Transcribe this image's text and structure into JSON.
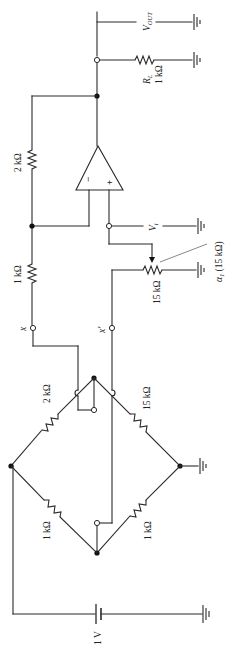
{
  "diagram": {
    "type": "circuit-schematic",
    "orientation": "rotated-90",
    "colors": {
      "wire": "#2a2a2a",
      "background": "#ffffff",
      "node": "#111111"
    }
  },
  "labels": {
    "vout": "V",
    "vout_sub": "OUT",
    "rl_name": "R",
    "rl_sub": "L",
    "rl_value": "1 kΩ",
    "rf_value": "2 kΩ",
    "rin_value": "1 kΩ",
    "vi": "V",
    "vi_sub": "i",
    "pot_value": "15 kΩ",
    "pot_wiper": "α",
    "pot_wiper_sub": "1",
    "pot_wiper_rest": " (15 kΩ)",
    "term_x": "x",
    "term_x_prime": "x′",
    "bridge_top_left": "2 kΩ",
    "bridge_top_right": "15 kΩ",
    "bridge_bottom_left": "1 kΩ",
    "bridge_bottom_right": "1 kΩ",
    "battery": "1 V",
    "opamp_minus": "−",
    "opamp_plus": "+"
  },
  "components": [
    {
      "id": "RL",
      "type": "resistor",
      "value": "1 kΩ",
      "role": "load"
    },
    {
      "id": "Rf",
      "type": "resistor",
      "value": "2 kΩ",
      "role": "feedback"
    },
    {
      "id": "Rin",
      "type": "resistor",
      "value": "1 kΩ",
      "role": "input"
    },
    {
      "id": "Rpot",
      "type": "potentiometer",
      "value": "15 kΩ",
      "wiper": "α1 (15 kΩ)"
    },
    {
      "id": "R1",
      "type": "resistor",
      "value": "2 kΩ",
      "role": "bridge"
    },
    {
      "id": "R2",
      "type": "resistor",
      "value": "15 kΩ",
      "role": "bridge"
    },
    {
      "id": "R3",
      "type": "resistor",
      "value": "1 kΩ",
      "role": "bridge"
    },
    {
      "id": "R4",
      "type": "resistor",
      "value": "1 kΩ",
      "role": "bridge"
    },
    {
      "id": "U1",
      "type": "op-amp"
    },
    {
      "id": "V1",
      "type": "battery",
      "value": "1 V"
    }
  ]
}
